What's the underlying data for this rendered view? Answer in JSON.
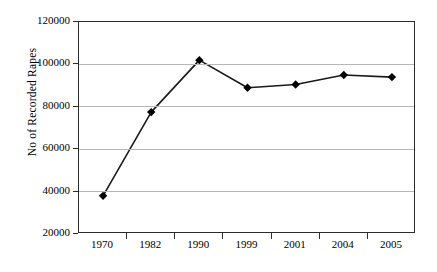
{
  "chart_data": {
    "type": "line",
    "title": "",
    "xlabel": "",
    "ylabel": "No of Recorded Rapes",
    "categories": [
      "1970",
      "1982",
      "1990",
      "1999",
      "2001",
      "2004",
      "2005"
    ],
    "values": [
      38000,
      77500,
      102000,
      89000,
      90500,
      95000,
      94000
    ],
    "series": [
      {
        "name": "No of Recorded Rapes",
        "values": [
          38000,
          77500,
          102000,
          89000,
          90500,
          95000,
          94000
        ]
      }
    ],
    "ylim": [
      20000,
      120000
    ],
    "ytick_labels": [
      "20000",
      "40000",
      "60000",
      "80000",
      "100000",
      "120000"
    ],
    "ytick_values": [
      20000,
      40000,
      60000,
      80000,
      100000,
      120000
    ],
    "grid": true,
    "legend": "none",
    "marker": "diamond",
    "marker_color": "#000000",
    "line_color": "#1a1a1a",
    "gridline_color": "#b7b7b7",
    "axis_color": "#2b2b2b",
    "background_color": "#ffffff"
  }
}
